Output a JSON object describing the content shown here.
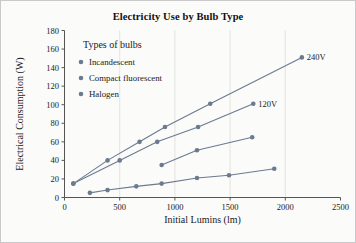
{
  "figure": {
    "background_color": "#fbfbfa",
    "border_color": "#c9c9c9",
    "series_color": "#6b7a8f",
    "axis_color": "#555555",
    "grid_color": "#dcdcdc"
  },
  "chart_data": {
    "type": "line",
    "title": "Electricity Use by Bulb Type",
    "xlabel": "Initial Lumins (lm)",
    "ylabel": "Electrical Consumption (W)",
    "xlim": [
      0,
      2500
    ],
    "ylim": [
      0,
      180
    ],
    "xticks": [
      0,
      500,
      1000,
      1500,
      2000,
      2500
    ],
    "yticks": [
      0,
      20,
      40,
      60,
      80,
      100,
      120,
      140,
      160,
      180
    ],
    "grid": true,
    "grid_axis": "x",
    "legend_title": "Types of bulbs",
    "legend_position": "upper-left-inside",
    "legend_entries": [
      "Incandescent",
      "Compact fluorescent",
      "Halogen"
    ],
    "annotations": [
      {
        "text": "240V",
        "x": 2150,
        "y": 151
      },
      {
        "text": "120V",
        "x": 1710,
        "y": 101
      }
    ],
    "series": [
      {
        "name": "Incandescent 240V",
        "legend_entry": "Incandescent",
        "annotation": "240V",
        "points": [
          {
            "x": 80,
            "y": 15
          },
          {
            "x": 390,
            "y": 40
          },
          {
            "x": 680,
            "y": 60
          },
          {
            "x": 910,
            "y": 76
          },
          {
            "x": 1320,
            "y": 101
          },
          {
            "x": 2150,
            "y": 151
          }
        ]
      },
      {
        "name": "Incandescent 120V",
        "legend_entry": "Incandescent",
        "annotation": "120V",
        "points": [
          {
            "x": 80,
            "y": 15
          },
          {
            "x": 500,
            "y": 40
          },
          {
            "x": 840,
            "y": 60
          },
          {
            "x": 1210,
            "y": 76
          },
          {
            "x": 1710,
            "y": 101
          }
        ]
      },
      {
        "name": "Compact fluorescent",
        "legend_entry": "Compact fluorescent",
        "annotation": "",
        "points": [
          {
            "x": 880,
            "y": 35
          },
          {
            "x": 1200,
            "y": 51
          },
          {
            "x": 1700,
            "y": 65
          }
        ]
      },
      {
        "name": "Halogen",
        "legend_entry": "Halogen",
        "annotation": "",
        "points": [
          {
            "x": 230,
            "y": 5
          },
          {
            "x": 390,
            "y": 8
          },
          {
            "x": 650,
            "y": 12
          },
          {
            "x": 880,
            "y": 15
          },
          {
            "x": 1200,
            "y": 21
          },
          {
            "x": 1490,
            "y": 24
          },
          {
            "x": 1900,
            "y": 31
          }
        ]
      }
    ]
  }
}
